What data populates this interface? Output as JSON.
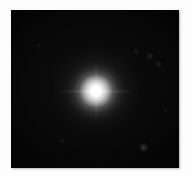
{
  "image": {
    "type": "astronomical-point-source",
    "description": "Black sky field containing one bright unresolved point source with a soft circular halo",
    "background_color": "#ffffff",
    "sky_color": "#000000",
    "source_color": "#ffffff",
    "frame": {
      "x": 11,
      "y": 10,
      "width": 168,
      "height": 158
    }
  },
  "primary_source": {
    "name": "bright-point-source",
    "center_x": 96,
    "center_y": 91,
    "core_radius": 7,
    "inner_halo_radius": 17,
    "mid_halo_radius": 28,
    "outer_halo_radius": 44,
    "peak_color": "#ffffff"
  },
  "faint_sources": [
    {
      "name": "faint-source-1",
      "center_x": 142,
      "center_y": 147,
      "radius": 4,
      "brightness": 0.2
    },
    {
      "name": "faint-source-2",
      "center_x": 152,
      "center_y": 56,
      "radius": 3,
      "brightness": 0.13
    },
    {
      "name": "faint-source-3",
      "center_x": 160,
      "center_y": 64,
      "radius": 3,
      "brightness": 0.1
    },
    {
      "name": "faint-source-4",
      "center_x": 137,
      "center_y": 50,
      "radius": 2,
      "brightness": 0.08
    },
    {
      "name": "faint-source-5",
      "center_x": 62,
      "center_y": 140,
      "radius": 2,
      "brightness": 0.07
    },
    {
      "name": "faint-source-6",
      "center_x": 40,
      "center_y": 45,
      "radius": 2,
      "brightness": 0.06
    },
    {
      "name": "faint-source-7",
      "center_x": 168,
      "center_y": 110,
      "radius": 2,
      "brightness": 0.06
    }
  ],
  "streaks": {
    "horizontal": {
      "width": 78,
      "height": 3
    },
    "vertical": {
      "width": 3,
      "height": 62
    }
  }
}
